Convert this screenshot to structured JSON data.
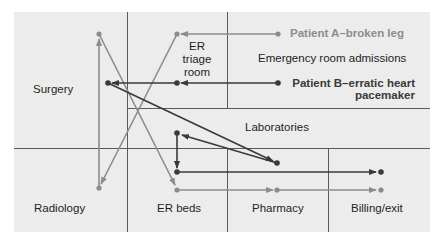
{
  "diagram": {
    "colors": {
      "panel": "#ececec",
      "grid": "#5a5a5a",
      "patient_a": "#8c8c8c",
      "patient_b": "#3a3a3a",
      "text": "#1e1e1e"
    },
    "departments": {
      "surgery": "Surgery",
      "er_triage": [
        "ER",
        "triage",
        "room"
      ],
      "admissions": "Emergency room admissions",
      "laboratories": "Laboratories",
      "radiology": "Radiology",
      "er_beds": "ER beds",
      "pharmacy": "Pharmacy",
      "billing": "Billing/exit"
    },
    "patients": {
      "a": {
        "label": "Patient A–broken leg"
      },
      "b": {
        "label_line1": "Patient B–erratic heart",
        "label_line2": "pacemaker"
      }
    },
    "flows": {
      "patient_a": [
        "Emergency room admissions",
        "ER triage room",
        "Radiology",
        "Surgery",
        "ER beds",
        "Pharmacy",
        "Billing/exit"
      ],
      "patient_b": [
        "Emergency room admissions",
        "ER triage room",
        "Surgery",
        "Laboratories",
        "Laboratories",
        "Laboratories",
        "Billing/exit"
      ]
    }
  }
}
